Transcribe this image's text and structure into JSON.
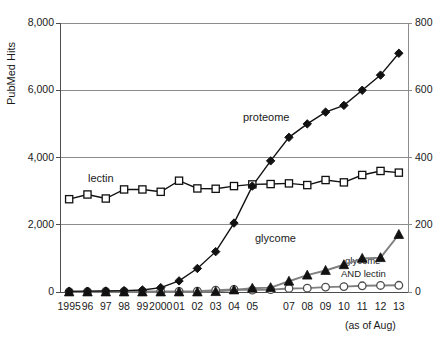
{
  "chart_data": {
    "type": "line",
    "title": "",
    "xlabel": "",
    "ylabel": "PubMed Hits",
    "ylabel_right": "",
    "note": "(as of Aug)",
    "grid": true,
    "legend_position": "inline-annotations",
    "categories": [
      "1995",
      "96",
      "97",
      "98",
      "99",
      "2000",
      "01",
      "02",
      "03",
      "04",
      "05",
      "",
      "07",
      "08",
      "09",
      "10",
      "11",
      "12",
      "13"
    ],
    "x_tick_labels": [
      "1995",
      "96",
      "97",
      "98",
      "99",
      "2000",
      "01",
      "02",
      "03",
      "04",
      "05",
      "07",
      "08",
      "09",
      "10",
      "11",
      "12",
      "13"
    ],
    "years": [
      1995,
      1996,
      1997,
      1998,
      1999,
      2000,
      2001,
      2002,
      2003,
      2004,
      2005,
      2006,
      2007,
      2008,
      2009,
      2010,
      2011,
      2012,
      2013
    ],
    "ylim": [
      0,
      8000
    ],
    "y_ticks": [
      0,
      2000,
      4000,
      6000,
      8000
    ],
    "y_tick_labels": [
      "0",
      "2,000",
      "4,000",
      "6,000",
      "8,000"
    ],
    "ylim_right": [
      0,
      800
    ],
    "y_ticks_right": [
      0,
      200,
      400,
      600,
      800
    ],
    "y_tick_labels_right": [
      "0",
      "200",
      "400",
      "600",
      "800"
    ],
    "series": [
      {
        "name": "proteome",
        "axis": "left",
        "marker": "filled-diamond",
        "color": "#111111",
        "values": [
          20,
          25,
          30,
          40,
          60,
          130,
          330,
          700,
          1200,
          2050,
          3150,
          3900,
          4600,
          5000,
          5350,
          5550,
          6000,
          6450,
          7100
        ]
      },
      {
        "name": "lectin",
        "axis": "left",
        "marker": "open-square",
        "color": "#111111",
        "values": [
          2760,
          2900,
          2780,
          3050,
          3050,
          2980,
          3310,
          3080,
          3070,
          3150,
          3200,
          3210,
          3230,
          3180,
          3330,
          3260,
          3480,
          3600,
          3550
        ]
      },
      {
        "name": "glycome",
        "axis": "left",
        "marker": "filled-triangle",
        "color": "#808080",
        "values": [
          0,
          0,
          0,
          0,
          0,
          0,
          0,
          0,
          10,
          60,
          110,
          130,
          320,
          500,
          640,
          810,
          1000,
          1020,
          1710
        ]
      },
      {
        "name": "glycome AND lectin",
        "axis": "left",
        "marker": "open-circle",
        "color": "#808080",
        "values": [
          10,
          10,
          15,
          20,
          20,
          15,
          15,
          25,
          55,
          75,
          55,
          70,
          105,
          115,
          145,
          160,
          185,
          195,
          200
        ]
      }
    ],
    "annotations": [
      {
        "text": "proteome",
        "x": 243,
        "y": 111
      },
      {
        "text": "lectin",
        "x": 88,
        "y": 172
      },
      {
        "text": "glycome",
        "x": 255,
        "y": 232
      },
      {
        "text": "glycome",
        "x": 345,
        "y": 255
      },
      {
        "text": "AND lectin",
        "x": 341,
        "y": 268
      }
    ]
  }
}
